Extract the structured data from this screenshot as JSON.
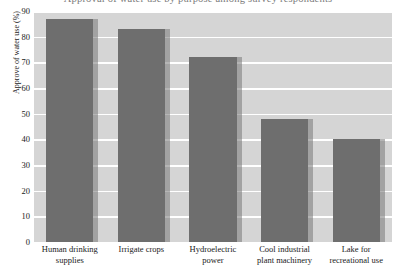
{
  "title_clipped": "Approval of water use by purpose among survey respondents",
  "chart_data": {
    "type": "bar",
    "title": "",
    "xlabel": "",
    "ylabel": "Approve of water use (%)",
    "categories": [
      "Human drinking supplies",
      "Irrigate crops",
      "Hydroelectric power",
      "Cool industrial plant machinery",
      "Lake for recreational use"
    ],
    "values": [
      87,
      83,
      72,
      48,
      40
    ],
    "ylim": [
      0,
      90
    ],
    "yticks": [
      0,
      10,
      20,
      30,
      40,
      50,
      60,
      70,
      80,
      90
    ],
    "ytick_labels": [
      "0",
      "10",
      "20",
      "30",
      "40",
      "50",
      "60",
      "70",
      "80",
      "90"
    ],
    "grid": true,
    "legend": "none",
    "colors": {
      "bar": "#6e6e6e",
      "bar_shadow": "#787878",
      "plot_background": "#d5d5d5",
      "gridline": "#ffffff",
      "text": "#1a1a1a"
    }
  }
}
